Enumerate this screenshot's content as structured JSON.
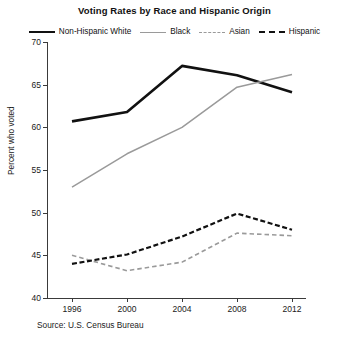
{
  "chart_data": {
    "type": "line",
    "title": "Voting Rates by Race and Hispanic Origin",
    "xlabel": "",
    "ylabel": "Percent who voted",
    "source": "Source: U.S. Census Bureau",
    "x": [
      1996,
      2000,
      2004,
      2008,
      2012
    ],
    "xtick_labels": [
      "1996",
      "2000",
      "2004",
      "2008",
      "2012"
    ],
    "ytick_labels": [
      "40",
      "45",
      "50",
      "55",
      "60",
      "65",
      "70"
    ],
    "yticks": [
      40,
      45,
      50,
      55,
      60,
      65,
      70
    ],
    "ylim": [
      40,
      70
    ],
    "xlim": [
      1995,
      2013
    ],
    "grid": false,
    "legend_position": "top-center",
    "series": [
      {
        "name": "Non-Hispanic White",
        "values": [
          60.7,
          61.8,
          67.2,
          66.1,
          64.1
        ],
        "color": "#111111",
        "style": "solid",
        "width": 2.6
      },
      {
        "name": "Black",
        "values": [
          53.0,
          56.9,
          60.0,
          64.7,
          66.2
        ],
        "color": "#9a9a9a",
        "style": "solid",
        "width": 1.5
      },
      {
        "name": "Asian",
        "values": [
          45.0,
          43.2,
          44.2,
          47.6,
          47.3
        ],
        "color": "#9a9a9a",
        "style": "dashed",
        "width": 1.6
      },
      {
        "name": "Hispanic",
        "values": [
          44.0,
          45.1,
          47.2,
          49.9,
          48.0
        ],
        "color": "#111111",
        "style": "dashed",
        "width": 2.2
      }
    ]
  }
}
